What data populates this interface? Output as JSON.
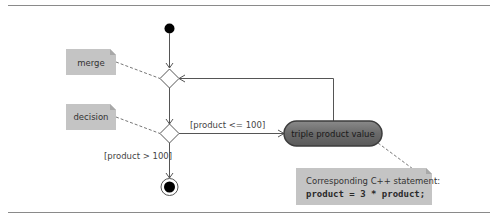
{
  "diagram": {
    "type": "UML activity diagram",
    "notes": {
      "merge": "merge",
      "decision": "decision",
      "cpp_title": "Corresponding C++ statement:",
      "cpp_code": "product = 3 * product;"
    },
    "guards": {
      "true_branch": "[product <= 100]",
      "false_branch": "[product > 100]"
    },
    "action": {
      "label": "triple product value"
    },
    "colors": {
      "note_fill": "#c4c4c4",
      "note_fold": "#a8a8a8",
      "action_fill": "#6b6b6b",
      "action_stroke": "#3c3c3c",
      "line": "#555555",
      "rule": "#8a8a8a",
      "state_fill": "#000000"
    }
  }
}
